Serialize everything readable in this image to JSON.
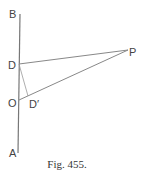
{
  "figure": {
    "caption": "Fig. 455.",
    "labels": {
      "B": "B",
      "D": "D",
      "O": "O",
      "A": "A",
      "P": "P",
      "D_prime": "D′"
    },
    "colors": {
      "line": "#777777",
      "text": "#444444"
    }
  }
}
